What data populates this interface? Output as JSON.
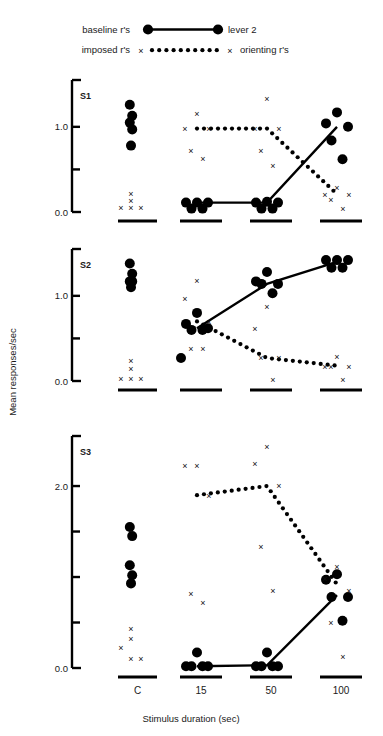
{
  "figure": {
    "background": "#ffffff",
    "ink": "#000000"
  },
  "legend": {
    "items": [
      {
        "left_label": "baseline r's",
        "right_label": "lever 2",
        "style": "solid-line-filled-circles"
      },
      {
        "left_label": "imposed r's",
        "right_label": "orienting r's",
        "style": "dotted-line-x-markers"
      }
    ]
  },
  "axes": {
    "ylabel": "Mean responses/sec",
    "xlabel": "Stimulus duration (sec)",
    "categories": [
      "C",
      "15",
      "50",
      "100"
    ]
  },
  "chart_data": {
    "type": "scatter",
    "title": "",
    "xlabel": "Stimulus duration (sec)",
    "ylabel": "Mean responses/sec",
    "categories": [
      "C",
      "15",
      "50",
      "100"
    ],
    "grid": false,
    "legend_position": "top",
    "panels": [
      {
        "name": "S1",
        "ylim": [
          0.0,
          1.5
        ],
        "yticks": [
          0.0,
          0.5,
          1.0
        ],
        "ytick_labels": [
          "0.0",
          "",
          "1.0"
        ],
        "series": [
          {
            "name": "baseline r's",
            "marker": "filled-circle",
            "line": "solid",
            "points": {
              "C": [
                1.26,
                1.13,
                1.05,
                0.97,
                0.78
              ],
              "15": [
                0.11,
                0.11,
                0.11,
                0.04,
                0.04
              ],
              "50": [
                0.12,
                0.11,
                0.11,
                0.04,
                0.04
              ],
              "100": [
                1.17,
                1.04,
                1.0,
                0.84,
                0.62
              ]
            },
            "line_values": {
              "15": 0.11,
              "50": 0.11,
              "100": 1.0
            }
          },
          {
            "name": "imposed r's",
            "marker": "x",
            "line": "dotted",
            "points": {
              "C": [
                0.22,
                0.13,
                0.05,
                0.05,
                0.05
              ],
              "15": [
                1.15,
                0.98,
                0.98,
                0.72,
                0.63
              ],
              "50": [
                1.33,
                0.98,
                0.98,
                0.72,
                0.55
              ],
              "100": [
                0.29,
                0.21,
                0.21,
                0.14,
                0.04
              ]
            },
            "line_values": {
              "15": 0.98,
              "50": 0.98,
              "100": 0.21
            }
          }
        ]
      },
      {
        "name": "S2",
        "ylim": [
          0.0,
          1.5
        ],
        "yticks": [
          0.0,
          0.5,
          1.0
        ],
        "ytick_labels": [
          "0.0",
          "",
          "1.0"
        ],
        "series": [
          {
            "name": "baseline r's",
            "marker": "filled-circle",
            "line": "solid",
            "points": {
              "C": [
                1.38,
                1.26,
                1.17,
                1.17,
                1.1
              ],
              "15": [
                0.8,
                0.67,
                0.62,
                0.6,
                0.6,
                0.27
              ],
              "50": [
                1.28,
                1.17,
                1.14,
                1.14,
                1.03
              ],
              "100": [
                1.42,
                1.42,
                1.42,
                1.33,
                1.33
              ]
            },
            "line_values": {
              "15": 0.62,
              "50": 1.14,
              "100": 1.4
            }
          },
          {
            "name": "imposed r's",
            "marker": "x",
            "line": "dotted",
            "points": {
              "C": [
                0.24,
                0.14,
                0.03,
                0.03,
                0.03
              ],
              "15": [
                1.18,
                0.97,
                0.7,
                0.38,
                0.38
              ],
              "50": [
                0.87,
                0.62,
                0.27,
                0.27,
                0.02
              ],
              "100": [
                0.29,
                0.17,
                0.17,
                0.17,
                0.02
              ]
            },
            "line_values": {
              "15": 0.7,
              "50": 0.27,
              "100": 0.18
            }
          }
        ]
      },
      {
        "name": "S3",
        "ylim": [
          0.0,
          2.5
        ],
        "yticks": [
          0.0,
          0.5,
          1.0,
          1.5,
          2.0
        ],
        "ytick_labels": [
          "0.0",
          "",
          "",
          "",
          "2.0"
        ],
        "series": [
          {
            "name": "baseline r's",
            "marker": "filled-circle",
            "line": "solid",
            "points": {
              "C": [
                1.55,
                1.45,
                1.13,
                1.02,
                0.93
              ],
              "15": [
                0.17,
                0.02,
                0.02,
                0.02,
                0.02
              ],
              "50": [
                0.17,
                0.02,
                0.02,
                0.02,
                0.02
              ],
              "100": [
                1.03,
                0.97,
                0.78,
                0.78,
                0.52
              ]
            },
            "line_values": {
              "15": 0.02,
              "50": 0.03,
              "100": 0.8
            }
          },
          {
            "name": "imposed r's",
            "marker": "x",
            "line": "dotted",
            "points": {
              "C": [
                0.43,
                0.32,
                0.22,
                0.1,
                0.1
              ],
              "15": [
                2.22,
                2.22,
                1.9,
                0.82,
                0.72
              ],
              "50": [
                2.43,
                2.25,
                2.0,
                1.33,
                0.85
              ],
              "100": [
                1.12,
                0.98,
                0.85,
                0.5,
                0.12
              ]
            },
            "line_values": {
              "15": 1.9,
              "50": 2.0,
              "100": 0.92
            }
          }
        ]
      }
    ]
  }
}
